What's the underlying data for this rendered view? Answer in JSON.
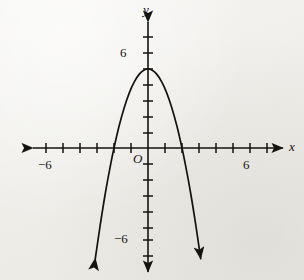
{
  "figure": {
    "kind": "coordinate-plane-graph",
    "background_color": "#f0efec",
    "ink_color": "#15130f"
  },
  "labels": {
    "x_axis": "x",
    "y_axis": "y",
    "origin": "O",
    "x_neg": "−6",
    "x_pos": "6",
    "y_pos": "6",
    "y_neg": "−6"
  },
  "chart_data": {
    "type": "line",
    "title": "",
    "subtitle": "",
    "xlabel": "x",
    "ylabel": "y",
    "xlim": [
      -8,
      8
    ],
    "ylim": [
      -8,
      8
    ],
    "grid": false,
    "legend": "none",
    "axis_style": "double-headed arrows, centered at origin",
    "x_tick_labels": [
      "−6",
      "6"
    ],
    "y_tick_labels": [
      "6",
      "−6"
    ],
    "x_ticks": [
      -7,
      -6,
      -5,
      -4,
      -3,
      -2,
      -1,
      1,
      2,
      3,
      4,
      5,
      6,
      7
    ],
    "y_ticks": [
      -7,
      -6,
      -5,
      -4,
      -3,
      -2,
      -1,
      1,
      2,
      3,
      4,
      5,
      6,
      7
    ],
    "origin_label": "O",
    "curves": [
      {
        "name": "downward parabola",
        "equation": "y = -1.25x^2 + 5",
        "vertex": [
          0,
          5
        ],
        "opens": "down",
        "x_intercepts": [
          -2,
          2
        ],
        "y_intercept": 5,
        "arrowheads": [
          "start",
          "end"
        ],
        "x_range": [
          -3.1,
          3.1
        ],
        "points": [
          [
            -3.1,
            -7.0
          ],
          [
            -2.8,
            -4.8
          ],
          [
            -2.5,
            -2.8
          ],
          [
            -2.2,
            -1.05
          ],
          [
            -2.0,
            0.0
          ],
          [
            -1.7,
            1.39
          ],
          [
            -1.4,
            2.55
          ],
          [
            -1.1,
            3.49
          ],
          [
            -0.8,
            4.2
          ],
          [
            -0.5,
            4.69
          ],
          [
            -0.25,
            4.92
          ],
          [
            0.0,
            5.0
          ],
          [
            0.25,
            4.92
          ],
          [
            0.5,
            4.69
          ],
          [
            0.8,
            4.2
          ],
          [
            1.1,
            3.49
          ],
          [
            1.4,
            2.55
          ],
          [
            1.7,
            1.39
          ],
          [
            2.0,
            0.0
          ],
          [
            2.2,
            -1.05
          ],
          [
            2.5,
            -2.8
          ],
          [
            2.8,
            -4.8
          ],
          [
            3.1,
            -7.0
          ]
        ]
      }
    ]
  }
}
